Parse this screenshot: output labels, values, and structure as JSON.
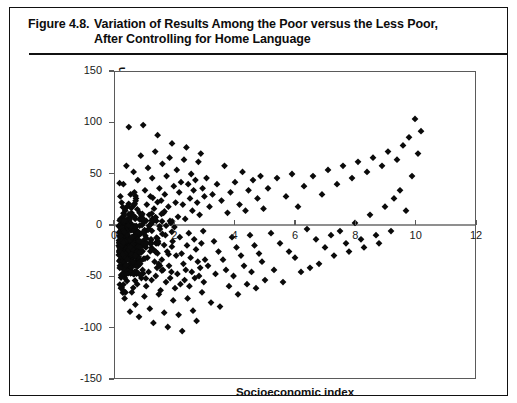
{
  "figure": {
    "number": "Figure 4.8.",
    "title_line1": "Variation of Results Among the Poor versus the Less Poor,",
    "title_line2": "After Controlling for Home Language"
  },
  "chart_data": {
    "type": "scatter",
    "xlabel": "Socioeconomic index",
    "ylabel": "Residuals of regression of Spanish results on home language",
    "ylabel_line1": "Residuals of regression of Spanish results on",
    "ylabel_line2": "home language",
    "xlim": [
      0,
      12
    ],
    "ylim": [
      -150,
      150
    ],
    "xticks": [
      0,
      2,
      4,
      6,
      8,
      10,
      12
    ],
    "xtick_labels": [
      "0",
      "2",
      "4",
      "6",
      "8",
      "10",
      "12"
    ],
    "yticks": [
      150,
      100,
      50,
      0,
      -50,
      -100,
      -150
    ],
    "ytick_labels": [
      "150",
      "100",
      "50",
      "0",
      "-50",
      "-100",
      "-150"
    ],
    "grid": false,
    "legend": false,
    "marker": "diamond",
    "marker_color": "#0a0a0a",
    "marker_size": 3.4,
    "zero_line_y": 0,
    "n_points": 560,
    "points": [
      [
        0.12,
        -1
      ],
      [
        0.15,
        -35
      ],
      [
        0.18,
        6
      ],
      [
        0.2,
        -62
      ],
      [
        0.22,
        22
      ],
      [
        0.24,
        -18
      ],
      [
        0.26,
        -48
      ],
      [
        0.28,
        40
      ],
      [
        0.3,
        -8
      ],
      [
        0.32,
        -72
      ],
      [
        0.34,
        14
      ],
      [
        0.36,
        -28
      ],
      [
        0.38,
        58
      ],
      [
        0.4,
        -55
      ],
      [
        0.42,
        2
      ],
      [
        0.44,
        -40
      ],
      [
        0.46,
        96
      ],
      [
        0.48,
        -15
      ],
      [
        0.5,
        -85
      ],
      [
        0.52,
        30
      ],
      [
        0.54,
        -5
      ],
      [
        0.56,
        -66
      ],
      [
        0.58,
        18
      ],
      [
        0.6,
        -30
      ],
      [
        0.62,
        52
      ],
      [
        0.64,
        -48
      ],
      [
        0.66,
        8
      ],
      [
        0.68,
        -78
      ],
      [
        0.7,
        26
      ],
      [
        0.72,
        -12
      ],
      [
        0.74,
        -58
      ],
      [
        0.76,
        44
      ],
      [
        0.78,
        -22
      ],
      [
        0.8,
        -90
      ],
      [
        0.82,
        12
      ],
      [
        0.84,
        -38
      ],
      [
        0.86,
        68
      ],
      [
        0.88,
        -52
      ],
      [
        0.9,
        0
      ],
      [
        0.92,
        -44
      ],
      [
        0.94,
        98
      ],
      [
        0.96,
        -20
      ],
      [
        0.98,
        -70
      ],
      [
        1.0,
        34
      ],
      [
        1.02,
        -6
      ],
      [
        1.04,
        -60
      ],
      [
        1.06,
        20
      ],
      [
        1.08,
        -32
      ],
      [
        1.1,
        56
      ],
      [
        1.12,
        -46
      ],
      [
        1.14,
        10
      ],
      [
        1.16,
        -82
      ],
      [
        1.18,
        28
      ],
      [
        1.2,
        -14
      ],
      [
        1.22,
        -54
      ],
      [
        1.24,
        46
      ],
      [
        1.26,
        -24
      ],
      [
        1.28,
        -96
      ],
      [
        1.3,
        16
      ],
      [
        1.32,
        -36
      ],
      [
        1.34,
        72
      ],
      [
        1.36,
        -50
      ],
      [
        1.38,
        4
      ],
      [
        1.4,
        -42
      ],
      [
        1.42,
        88
      ],
      [
        1.44,
        -18
      ],
      [
        1.46,
        -68
      ],
      [
        1.48,
        36
      ],
      [
        1.5,
        -4
      ],
      [
        1.52,
        -64
      ],
      [
        1.54,
        24
      ],
      [
        1.56,
        -34
      ],
      [
        1.58,
        60
      ],
      [
        1.6,
        -44
      ],
      [
        1.62,
        12
      ],
      [
        1.64,
        -86
      ],
      [
        1.66,
        30
      ],
      [
        1.68,
        -10
      ],
      [
        1.7,
        -56
      ],
      [
        1.72,
        48
      ],
      [
        1.74,
        -26
      ],
      [
        1.76,
        -100
      ],
      [
        1.78,
        18
      ],
      [
        1.8,
        -40
      ],
      [
        1.82,
        66
      ],
      [
        1.84,
        -52
      ],
      [
        1.86,
        2
      ],
      [
        1.88,
        -46
      ],
      [
        1.9,
        80
      ],
      [
        1.92,
        -16
      ],
      [
        1.94,
        -74
      ],
      [
        1.96,
        38
      ],
      [
        1.98,
        -2
      ],
      [
        2.0,
        -62
      ],
      [
        2.02,
        22
      ],
      [
        2.04,
        -30
      ],
      [
        2.06,
        54
      ],
      [
        2.08,
        -48
      ],
      [
        2.1,
        8
      ],
      [
        2.12,
        -88
      ],
      [
        2.14,
        32
      ],
      [
        2.16,
        -12
      ],
      [
        2.18,
        -58
      ],
      [
        2.2,
        42
      ],
      [
        2.22,
        -28
      ],
      [
        2.24,
        -104
      ],
      [
        2.26,
        20
      ],
      [
        2.28,
        -38
      ],
      [
        2.3,
        64
      ],
      [
        2.32,
        -54
      ],
      [
        2.34,
        6
      ],
      [
        2.36,
        -44
      ],
      [
        2.38,
        76
      ],
      [
        2.4,
        -20
      ],
      [
        2.42,
        -72
      ],
      [
        2.44,
        40
      ],
      [
        2.46,
        -8
      ],
      [
        2.48,
        -60
      ],
      [
        2.5,
        26
      ],
      [
        2.52,
        -32
      ],
      [
        2.54,
        50
      ],
      [
        2.56,
        -46
      ],
      [
        2.58,
        14
      ],
      [
        2.6,
        -84
      ],
      [
        2.62,
        34
      ],
      [
        2.64,
        -14
      ],
      [
        2.66,
        -52
      ],
      [
        2.68,
        44
      ],
      [
        2.7,
        -24
      ],
      [
        2.72,
        -94
      ],
      [
        2.74,
        22
      ],
      [
        2.76,
        -36
      ],
      [
        2.78,
        62
      ],
      [
        2.8,
        -50
      ],
      [
        2.82,
        10
      ],
      [
        2.84,
        -42
      ],
      [
        2.86,
        70
      ],
      [
        2.88,
        -18
      ],
      [
        2.9,
        -66
      ],
      [
        2.92,
        36
      ],
      [
        2.94,
        -6
      ],
      [
        2.96,
        -56
      ],
      [
        2.98,
        28
      ],
      [
        3.0,
        -34
      ],
      [
        3.05,
        46
      ],
      [
        3.1,
        -40
      ],
      [
        3.15,
        18
      ],
      [
        3.2,
        -76
      ],
      [
        3.25,
        30
      ],
      [
        3.3,
        -16
      ],
      [
        3.35,
        -48
      ],
      [
        3.4,
        40
      ],
      [
        3.45,
        -26
      ],
      [
        3.5,
        -80
      ],
      [
        3.55,
        24
      ],
      [
        3.6,
        -34
      ],
      [
        3.65,
        58
      ],
      [
        3.7,
        -44
      ],
      [
        3.75,
        12
      ],
      [
        3.8,
        -60
      ],
      [
        3.85,
        32
      ],
      [
        3.9,
        -12
      ],
      [
        3.95,
        -50
      ],
      [
        4.0,
        42
      ],
      [
        4.05,
        -22
      ],
      [
        4.1,
        -68
      ],
      [
        4.15,
        20
      ],
      [
        4.2,
        -30
      ],
      [
        4.25,
        52
      ],
      [
        4.3,
        -40
      ],
      [
        4.35,
        14
      ],
      [
        4.4,
        -58
      ],
      [
        4.45,
        34
      ],
      [
        4.5,
        -10
      ],
      [
        4.55,
        -46
      ],
      [
        4.6,
        44
      ],
      [
        4.65,
        -20
      ],
      [
        4.7,
        -62
      ],
      [
        4.75,
        26
      ],
      [
        4.8,
        -28
      ],
      [
        4.85,
        48
      ],
      [
        4.9,
        -36
      ],
      [
        4.95,
        16
      ],
      [
        5.0,
        -54
      ],
      [
        5.1,
        36
      ],
      [
        5.2,
        -8
      ],
      [
        5.3,
        -44
      ],
      [
        5.4,
        46
      ],
      [
        5.5,
        -18
      ],
      [
        5.6,
        -56
      ],
      [
        5.7,
        28
      ],
      [
        5.8,
        -26
      ],
      [
        5.9,
        50
      ],
      [
        6.0,
        -32
      ],
      [
        6.1,
        18
      ],
      [
        6.2,
        -46
      ],
      [
        6.3,
        38
      ],
      [
        6.4,
        -4
      ],
      [
        6.5,
        -42
      ],
      [
        6.6,
        48
      ],
      [
        6.7,
        -14
      ],
      [
        6.8,
        -38
      ],
      [
        6.9,
        30
      ],
      [
        7.0,
        -22
      ],
      [
        7.1,
        54
      ],
      [
        7.2,
        -10
      ],
      [
        7.3,
        -30
      ],
      [
        7.4,
        40
      ],
      [
        7.5,
        -6
      ],
      [
        7.6,
        58
      ],
      [
        7.7,
        -18
      ],
      [
        7.8,
        -26
      ],
      [
        7.9,
        46
      ],
      [
        8.0,
        2
      ],
      [
        8.1,
        62
      ],
      [
        8.2,
        -14
      ],
      [
        8.3,
        -22
      ],
      [
        8.4,
        52
      ],
      [
        8.5,
        10
      ],
      [
        8.6,
        66
      ],
      [
        8.7,
        -10
      ],
      [
        8.8,
        -18
      ],
      [
        8.9,
        58
      ],
      [
        9.0,
        18
      ],
      [
        9.1,
        72
      ],
      [
        9.2,
        -6
      ],
      [
        9.3,
        26
      ],
      [
        9.4,
        64
      ],
      [
        9.5,
        34
      ],
      [
        9.6,
        78
      ],
      [
        9.7,
        14
      ],
      [
        9.8,
        86
      ],
      [
        9.9,
        48
      ],
      [
        10.0,
        104
      ],
      [
        10.1,
        70
      ],
      [
        10.2,
        92
      ]
    ]
  }
}
